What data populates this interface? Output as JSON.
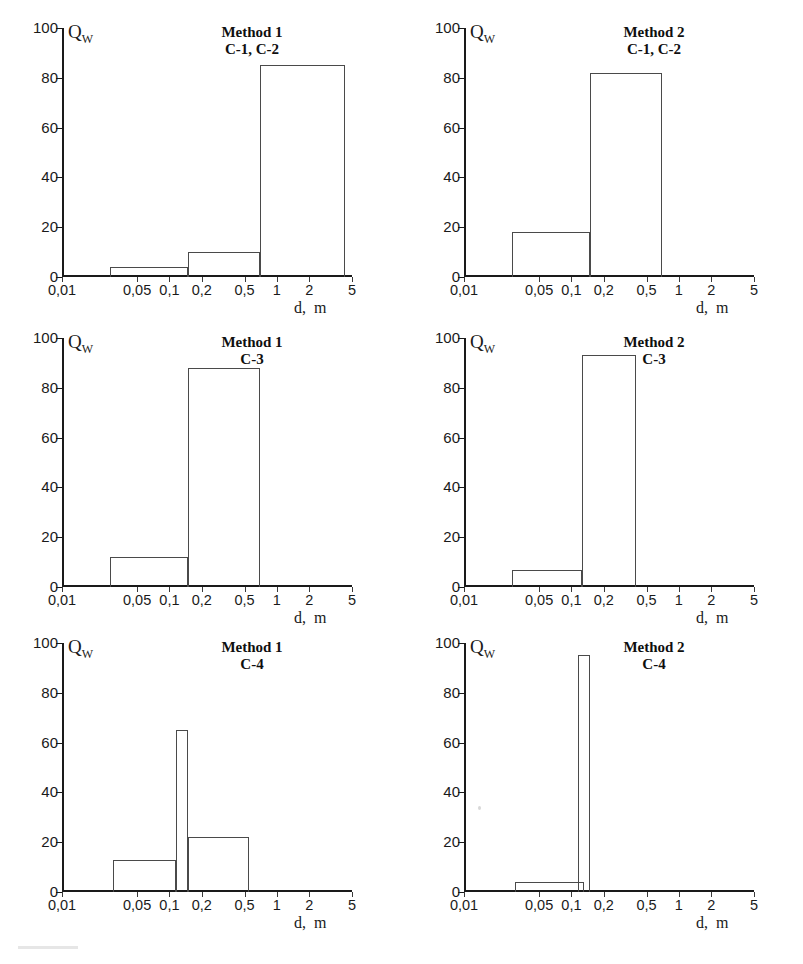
{
  "figure": {
    "axis": {
      "y_label": "Q",
      "y_label_sub": "W",
      "x_label": "d,  m",
      "y_ticks": [
        0,
        20,
        40,
        60,
        80,
        100
      ],
      "x_ticks": [
        {
          "value": 0.01,
          "label": "0,01"
        },
        {
          "value": 0.05,
          "label": "0,05"
        },
        {
          "value": 0.1,
          "label": "0,1"
        },
        {
          "value": 0.2,
          "label": "0,2"
        },
        {
          "value": 0.5,
          "label": "0,5"
        },
        {
          "value": 1,
          "label": "1"
        },
        {
          "value": 2,
          "label": "2"
        },
        {
          "value": 5,
          "label": "5"
        }
      ]
    }
  },
  "chart_data": [
    {
      "type": "bar",
      "title": "Method 1",
      "subtitle": "C-1, C-2",
      "xlabel": "d,  m",
      "ylabel": "Qw",
      "xscale": "log",
      "xlim": [
        0.01,
        5
      ],
      "ylim": [
        0,
        100
      ],
      "grid": false,
      "bins": [
        {
          "x_start": 0.028,
          "x_end": 0.15,
          "value": 4
        },
        {
          "x_start": 0.15,
          "x_end": 0.7,
          "value": 10
        },
        {
          "x_start": 0.7,
          "x_end": 4.3,
          "value": 85
        }
      ]
    },
    {
      "type": "bar",
      "title": "Method 2",
      "subtitle": "C-1, C-2",
      "xlabel": "d,  m",
      "ylabel": "Qw",
      "xscale": "log",
      "xlim": [
        0.01,
        5
      ],
      "ylim": [
        0,
        100
      ],
      "grid": false,
      "bins": [
        {
          "x_start": 0.028,
          "x_end": 0.15,
          "value": 18
        },
        {
          "x_start": 0.15,
          "x_end": 0.7,
          "value": 82
        }
      ]
    },
    {
      "type": "bar",
      "title": "Method 1",
      "subtitle": "C-3",
      "xlabel": "d,  m",
      "ylabel": "Qw",
      "xscale": "log",
      "xlim": [
        0.01,
        5
      ],
      "ylim": [
        0,
        100
      ],
      "grid": false,
      "bins": [
        {
          "x_start": 0.028,
          "x_end": 0.15,
          "value": 12
        },
        {
          "x_start": 0.15,
          "x_end": 0.7,
          "value": 88
        }
      ]
    },
    {
      "type": "bar",
      "title": "Method 2",
      "subtitle": "C-3",
      "xlabel": "d,  m",
      "ylabel": "Qw",
      "xscale": "log",
      "xlim": [
        0.01,
        5
      ],
      "ylim": [
        0,
        100
      ],
      "grid": false,
      "bins": [
        {
          "x_start": 0.028,
          "x_end": 0.125,
          "value": 7
        },
        {
          "x_start": 0.125,
          "x_end": 0.4,
          "value": 93
        }
      ]
    },
    {
      "type": "bar",
      "title": "Method 1",
      "subtitle": "C-4",
      "xlabel": "d,  m",
      "ylabel": "Qw",
      "xscale": "log",
      "xlim": [
        0.01,
        5
      ],
      "ylim": [
        0,
        100
      ],
      "grid": false,
      "bins": [
        {
          "x_start": 0.03,
          "x_end": 0.115,
          "value": 13
        },
        {
          "x_start": 0.115,
          "x_end": 0.15,
          "value": 65
        },
        {
          "x_start": 0.15,
          "x_end": 0.55,
          "value": 22
        }
      ]
    },
    {
      "type": "bar",
      "title": "Method 2",
      "subtitle": "C-4",
      "xlabel": "d,  m",
      "ylabel": "Qw",
      "xscale": "log",
      "xlim": [
        0.01,
        5
      ],
      "ylim": [
        0,
        100
      ],
      "grid": false,
      "bins": [
        {
          "x_start": 0.03,
          "x_end": 0.13,
          "value": 4
        },
        {
          "x_start": 0.115,
          "x_end": 0.15,
          "value": 95
        }
      ]
    }
  ]
}
